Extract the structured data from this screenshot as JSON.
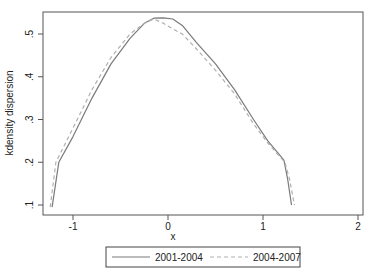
{
  "chart_data": {
    "type": "line",
    "title": "",
    "xlabel": "x",
    "ylabel": "kdensity dispersion",
    "xlim": [
      -1.32,
      2.05
    ],
    "ylim": [
      0.075,
      0.55
    ],
    "grid": false,
    "legend_position": "bottom",
    "x_ticks": [
      "-1",
      "0",
      "1",
      "2"
    ],
    "y_ticks": [
      ".1",
      ".2",
      ".3",
      ".4",
      ".5"
    ],
    "series": [
      {
        "name": "2001-2004",
        "style": "solid",
        "color": "#7a7a7a",
        "x": [
          -1.22,
          -1.15,
          -1.0,
          -0.8,
          -0.6,
          -0.4,
          -0.25,
          -0.15,
          -0.05,
          0.05,
          0.15,
          0.3,
          0.5,
          0.7,
          0.9,
          1.05,
          1.22,
          1.26,
          1.3
        ],
        "y": [
          0.095,
          0.2,
          0.26,
          0.35,
          0.43,
          0.49,
          0.525,
          0.537,
          0.538,
          0.535,
          0.52,
          0.48,
          0.43,
          0.37,
          0.3,
          0.25,
          0.205,
          0.16,
          0.1
        ]
      },
      {
        "name": "2004-2007",
        "style": "dashed",
        "color": "#b0b0b0",
        "x": [
          -1.24,
          -1.18,
          -1.0,
          -0.8,
          -0.6,
          -0.4,
          -0.25,
          -0.15,
          -0.05,
          0.05,
          0.15,
          0.3,
          0.5,
          0.7,
          0.9,
          1.05,
          1.23,
          1.28,
          1.33
        ],
        "y": [
          0.095,
          0.2,
          0.28,
          0.37,
          0.445,
          0.5,
          0.525,
          0.535,
          0.525,
          0.512,
          0.5,
          0.465,
          0.415,
          0.36,
          0.29,
          0.245,
          0.2,
          0.16,
          0.1
        ]
      }
    ]
  },
  "legend": {
    "items": [
      {
        "label": "2001-2004"
      },
      {
        "label": "2004-2007"
      }
    ]
  }
}
